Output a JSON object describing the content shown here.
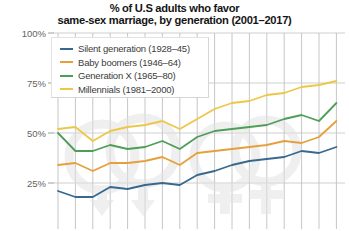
{
  "title": {
    "line1": "% of U.S adults who favor",
    "line2": "same-sex marriage, by generation (2001–2017)"
  },
  "axis": {
    "y_labels": [
      {
        "text": "100%",
        "value": 100
      },
      {
        "text": "75%",
        "value": 75
      },
      {
        "text": "50%",
        "value": 50
      },
      {
        "text": "25%",
        "value": 25
      },
      {
        "text": "0%",
        "value": 0
      }
    ]
  },
  "legend": {
    "items": [
      {
        "label": "Silent generation (1928–45)",
        "color": "#35698f"
      },
      {
        "label": "Baby boomers (1946–64)",
        "color": "#e5a03c"
      },
      {
        "label": "Generation X (1965–80)",
        "color": "#4f9e58"
      },
      {
        "label": "Millennials (1981–2000)",
        "color": "#ecc846"
      }
    ]
  },
  "chart_data": {
    "type": "line",
    "title": "% of U.S adults who favor same-sex marriage, by generation (2001–2017)",
    "xlabel": "",
    "ylabel": "",
    "x": [
      2001,
      2002,
      2003,
      2004,
      2005,
      2006,
      2007,
      2008,
      2009,
      2010,
      2011,
      2012,
      2013,
      2014,
      2015,
      2016,
      2017
    ],
    "xlim": [
      2001,
      2017
    ],
    "ylim": [
      0,
      100
    ],
    "grid": true,
    "legend_position": "top-left",
    "series": [
      {
        "name": "Silent generation (1928–45)",
        "color": "#35698f",
        "values": [
          21,
          18,
          18,
          23,
          22,
          24,
          25,
          24,
          29,
          31,
          34,
          36,
          37,
          38,
          41,
          40,
          43
        ]
      },
      {
        "name": "Baby boomers (1946–64)",
        "color": "#e5a03c",
        "values": [
          34,
          35,
          31,
          35,
          35,
          36,
          38,
          34,
          40,
          41,
          42,
          43,
          44,
          46,
          45,
          48,
          56
        ]
      },
      {
        "name": "Generation X (1965–80)",
        "color": "#4f9e58",
        "values": [
          50,
          41,
          41,
          44,
          42,
          43,
          46,
          42,
          48,
          51,
          52,
          53,
          54,
          57,
          59,
          56,
          65
        ]
      },
      {
        "name": "Millennials (1981–2000)",
        "color": "#ecc846",
        "values": [
          52,
          53,
          46,
          51,
          53,
          54,
          56,
          52,
          57,
          62,
          65,
          66,
          69,
          70,
          73,
          74,
          76
        ]
      }
    ]
  }
}
